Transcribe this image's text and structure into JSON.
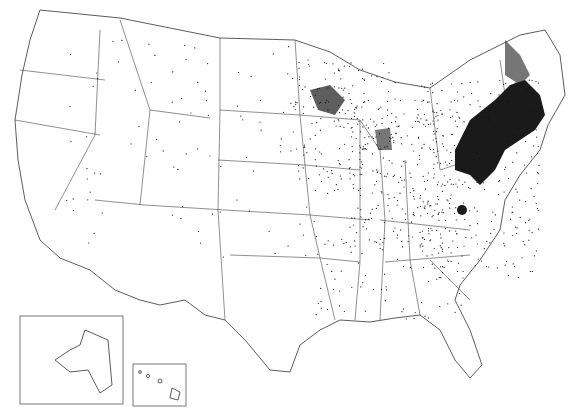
{
  "map": {
    "type": "dot-density",
    "region": "United States (contiguous) with Alaska and Hawaii insets",
    "colors": {
      "background": "#ffffff",
      "outline": "#333333",
      "dots": "#111111"
    },
    "insets": [
      {
        "name": "Alaska",
        "box": [
          20,
          316,
          103,
          88
        ]
      },
      {
        "name": "Hawaii",
        "box": [
          133,
          364,
          53,
          42
        ]
      }
    ],
    "density_regions": [
      {
        "name": "Northeast corridor",
        "level": "very high"
      },
      {
        "name": "New England",
        "level": "high"
      },
      {
        "name": "Upper Midwest (MN/WI)",
        "level": "medium"
      },
      {
        "name": "Great Lakes / Ohio Valley",
        "level": "medium"
      },
      {
        "name": "West / Plains",
        "level": "low"
      }
    ]
  }
}
